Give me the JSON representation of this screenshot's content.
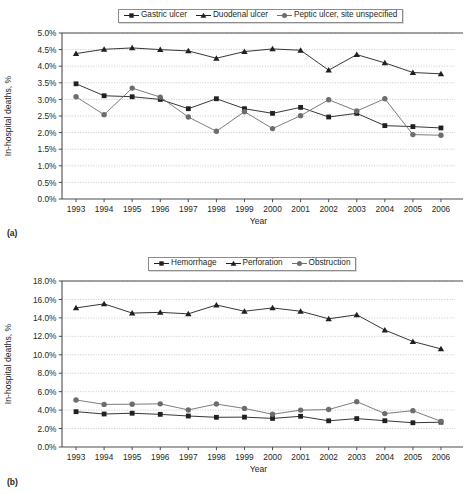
{
  "figure_a": {
    "panel_label": "(a)",
    "legend": [
      {
        "label": "Gastric ulcer",
        "marker": "square-marker-icon",
        "color": "#231f20"
      },
      {
        "label": "Duodenal ulcer",
        "marker": "triangle-marker-icon",
        "color": "#231f20"
      },
      {
        "label": "Peptic ulcer, site unspecified",
        "marker": "circle-marker-icon",
        "color": "#6d6d6d"
      }
    ],
    "chart_data": {
      "type": "line",
      "title": "",
      "xlabel": "Year",
      "ylabel": "In-hospital deaths, %",
      "x": [
        1993,
        1994,
        1995,
        1996,
        1997,
        1998,
        1999,
        2000,
        2001,
        2002,
        2003,
        2004,
        2005,
        2006
      ],
      "xticklabels": [
        "1993",
        "1994",
        "1995",
        "1996",
        "1997",
        "1998",
        "1999",
        "2000",
        "2001",
        "2002",
        "2003",
        "2004",
        "2005",
        "2006"
      ],
      "ylim": [
        0.0,
        5.0
      ],
      "yticks": [
        0.0,
        0.5,
        1.0,
        1.5,
        2.0,
        2.5,
        3.0,
        3.5,
        4.0,
        4.5,
        5.0
      ],
      "yticklabels": [
        "0.0%",
        "0.5%",
        "1.0%",
        "1.5%",
        "2.0%",
        "2.5%",
        "3.0%",
        "3.5%",
        "4.0%",
        "4.5%",
        "5.0%"
      ],
      "grid": true,
      "legend_position": "top",
      "series": [
        {
          "name": "Gastric ulcer",
          "marker": "square",
          "color": "#231f20",
          "values": [
            3.47,
            3.11,
            3.08,
            3.0,
            2.72,
            3.02,
            2.72,
            2.58,
            2.76,
            2.47,
            2.58,
            2.21,
            2.18,
            2.14
          ]
        },
        {
          "name": "Duodenal ulcer",
          "marker": "triangle",
          "color": "#231f20",
          "values": [
            4.38,
            4.51,
            4.55,
            4.5,
            4.46,
            4.24,
            4.44,
            4.52,
            4.48,
            3.88,
            4.35,
            4.1,
            3.81,
            3.77
          ]
        },
        {
          "name": "Peptic ulcer, site unspecified",
          "marker": "circle",
          "color": "#6d6d6d",
          "values": [
            3.08,
            2.54,
            3.34,
            3.07,
            2.47,
            2.04,
            2.63,
            2.12,
            2.51,
            2.99,
            2.65,
            3.02,
            1.94,
            1.92
          ]
        }
      ]
    }
  },
  "figure_b": {
    "panel_label": "(b)",
    "legend": [
      {
        "label": "Hemorrhage",
        "marker": "square-marker-icon",
        "color": "#231f20"
      },
      {
        "label": "Perforation",
        "marker": "triangle-marker-icon",
        "color": "#231f20"
      },
      {
        "label": "Obstruction",
        "marker": "circle-marker-icon",
        "color": "#6d6d6d"
      }
    ],
    "chart_data": {
      "type": "line",
      "title": "",
      "xlabel": "Year",
      "ylabel": "In-hospital deaths, %",
      "x": [
        1993,
        1994,
        1995,
        1996,
        1997,
        1998,
        1999,
        2000,
        2001,
        2002,
        2003,
        2004,
        2005,
        2006
      ],
      "xticklabels": [
        "1993",
        "1994",
        "1995",
        "1996",
        "1997",
        "1998",
        "1999",
        "2000",
        "2001",
        "2002",
        "2003",
        "2004",
        "2005",
        "2006"
      ],
      "ylim": [
        0.0,
        18.0
      ],
      "yticks": [
        0.0,
        2.0,
        4.0,
        6.0,
        8.0,
        10.0,
        12.0,
        14.0,
        16.0,
        18.0
      ],
      "yticklabels": [
        "0.0%",
        "2.0%",
        "4.0%",
        "6.0%",
        "8.0%",
        "10.0%",
        "12.0%",
        "14.0%",
        "16.0%",
        "18.0%"
      ],
      "grid": true,
      "legend_position": "top",
      "series": [
        {
          "name": "Hemorrhage",
          "marker": "square",
          "color": "#231f20",
          "values": [
            3.83,
            3.58,
            3.66,
            3.54,
            3.36,
            3.22,
            3.24,
            3.1,
            3.33,
            2.84,
            3.08,
            2.85,
            2.63,
            2.69
          ]
        },
        {
          "name": "Perforation",
          "marker": "triangle",
          "color": "#231f20",
          "values": [
            15.08,
            15.52,
            14.52,
            14.6,
            14.44,
            15.4,
            14.72,
            15.08,
            14.72,
            13.9,
            14.34,
            12.68,
            11.44,
            10.64
          ]
        },
        {
          "name": "Obstruction",
          "marker": "circle",
          "color": "#6d6d6d",
          "values": [
            5.1,
            4.62,
            4.64,
            4.68,
            4.02,
            4.66,
            4.18,
            3.55,
            4.0,
            4.06,
            4.92,
            3.62,
            3.94,
            2.78
          ]
        }
      ]
    }
  }
}
